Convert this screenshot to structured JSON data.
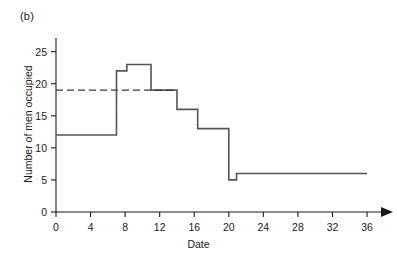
{
  "figure": {
    "panel_label": "(b)",
    "xlabel": "Date",
    "ylabel": "Number of men occupied"
  },
  "chart_data": {
    "type": "line",
    "subtype": "step",
    "title": "",
    "panel_label": "(b)",
    "xlabel": "Date",
    "ylabel": "Number of men occupied",
    "xlim": [
      0,
      37.5
    ],
    "ylim": [
      0,
      26.5
    ],
    "grid": false,
    "legend": null,
    "xticks": [
      0,
      4,
      8,
      12,
      16,
      20,
      24,
      28,
      32,
      36
    ],
    "xtick_labels": [
      "0",
      "4",
      "8",
      "12",
      "16",
      "20",
      "24",
      "28",
      "32",
      "36"
    ],
    "yticks": [
      0,
      5,
      10,
      15,
      20,
      25
    ],
    "ytick_labels": [
      "0",
      "5",
      "10",
      "15",
      "20",
      "25"
    ],
    "x_axis_arrow": true,
    "series": [
      {
        "name": "Men occupied",
        "style": "solid",
        "color": "#555555",
        "steps": [
          {
            "x_start": 0,
            "x_end": 7,
            "y": 12
          },
          {
            "x_start": 7,
            "x_end": 8.2,
            "y": 22
          },
          {
            "x_start": 8.2,
            "x_end": 11,
            "y": 23
          },
          {
            "x_start": 11,
            "x_end": 14,
            "y": 19
          },
          {
            "x_start": 14,
            "x_end": 16.4,
            "y": 16
          },
          {
            "x_start": 16.4,
            "x_end": 20,
            "y": 13
          },
          {
            "x_start": 20,
            "x_end": 20.9,
            "y": 5
          },
          {
            "x_start": 20.9,
            "x_end": 36,
            "y": 6
          }
        ]
      },
      {
        "name": "Reference level",
        "style": "dashed",
        "color": "#3a3a3a",
        "y": 19,
        "x_start": 0,
        "x_end": 13.9
      }
    ]
  }
}
